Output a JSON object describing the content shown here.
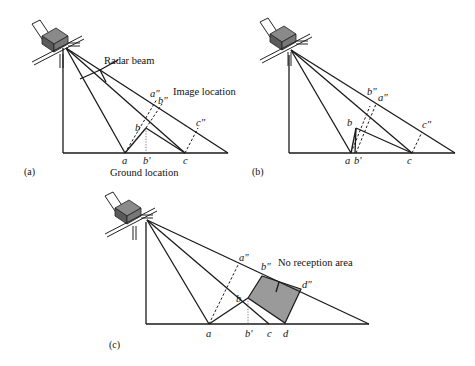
{
  "figure": {
    "panels": [
      {
        "id": "a",
        "label": "(a)",
        "annotations": {
          "radar_beam": "Radar beam",
          "image_location": "Image location",
          "ground_location": "Ground location"
        },
        "points": {
          "a": "a",
          "b": "b",
          "b_prime": "b'",
          "c": "c",
          "a_dd": "a\"",
          "b_dd": "b\"",
          "c_dd": "c\""
        }
      },
      {
        "id": "b",
        "label": "(b)",
        "points": {
          "a": "a",
          "b": "b",
          "b_prime": "b'",
          "c": "c",
          "a_dd": "a\"",
          "b_dd": "b\"",
          "c_dd": "c\""
        }
      },
      {
        "id": "c",
        "label": "(c)",
        "annotations": {
          "no_reception": "No reception area"
        },
        "points": {
          "a": "a",
          "b": "b",
          "b_prime": "b'",
          "c": "c",
          "d": "d",
          "a_dd": "a\"",
          "b_dd": "b\"",
          "d_dd": "d\""
        }
      }
    ],
    "colors": {
      "line": "#1a1a1a",
      "shadow_fill": "#9a9a9a",
      "satellite_body": "#6e6e6e"
    }
  }
}
